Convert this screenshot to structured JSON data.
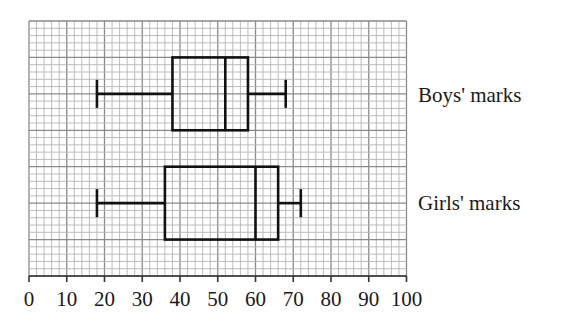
{
  "chart_data": {
    "type": "boxplot",
    "title": "",
    "xlabel": "",
    "ylabel": "",
    "xlim": [
      0,
      100
    ],
    "x_ticks": [
      0,
      10,
      20,
      30,
      40,
      50,
      60,
      70,
      80,
      90,
      100
    ],
    "grid": {
      "on": true,
      "minor_step": 2,
      "major_step": 10
    },
    "series": [
      {
        "name": "Boys' marks",
        "min": 18,
        "q1": 38,
        "median": 52,
        "q3": 58,
        "max": 68
      },
      {
        "name": "Girls' marks",
        "min": 18,
        "q1": 36,
        "median": 60,
        "q3": 66,
        "max": 72
      }
    ]
  },
  "labels": {
    "boys": "Boys' marks",
    "girls": "Girls' marks"
  },
  "colors": {
    "grid_minor": "#b5b5b5",
    "grid_major": "#8a8a8a",
    "plot": "#111111",
    "axis": "#333333"
  }
}
